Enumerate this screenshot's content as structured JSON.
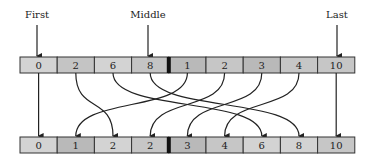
{
  "diagram": {
    "pointers": [
      {
        "label": "First",
        "x": 37
      },
      {
        "label": "Middle",
        "x": 148
      },
      {
        "label": "Last",
        "x": 337
      }
    ],
    "top_array": {
      "values": [
        "0",
        "2",
        "6",
        "8",
        "1",
        "2",
        "3",
        "4",
        "10"
      ],
      "shades": [
        "#d3d3d3",
        "#c4c4c4",
        "#d3d3d3",
        "#c4c4c4",
        "#b9b9b9",
        "#c6c6c6",
        "#b9b9b9",
        "#c6c6c6",
        "#c6c6c6"
      ],
      "divider_after_index": 3
    },
    "bottom_array": {
      "values": [
        "0",
        "1",
        "2",
        "2",
        "3",
        "4",
        "6",
        "8",
        "10"
      ],
      "shades": [
        "#d3d3d3",
        "#b9b9b9",
        "#d3d3d3",
        "#c6c6c6",
        "#b9b9b9",
        "#c6c6c6",
        "#d3d3d3",
        "#d3d3d3",
        "#c6c6c6"
      ],
      "divider_after_index": 3
    },
    "mapping": [
      {
        "from": 0,
        "to": 0
      },
      {
        "from": 1,
        "to": 2
      },
      {
        "from": 2,
        "to": 6
      },
      {
        "from": 3,
        "to": 7
      },
      {
        "from": 4,
        "to": 1
      },
      {
        "from": 5,
        "to": 3
      },
      {
        "from": 6,
        "to": 4
      },
      {
        "from": 7,
        "to": 5
      },
      {
        "from": 8,
        "to": 8
      }
    ],
    "colors": {
      "stroke": "#222222",
      "divider": "#111111"
    }
  }
}
